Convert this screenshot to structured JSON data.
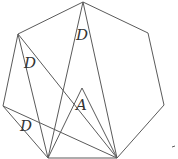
{
  "diagram": {
    "type": "geometry",
    "shape": "heptagon with inscribed triangles",
    "labels": [
      {
        "text": "D",
        "x": 76,
        "y": 40
      },
      {
        "text": "D",
        "x": 24,
        "y": 68
      },
      {
        "text": "A",
        "x": 76,
        "y": 110
      },
      {
        "text": "D",
        "x": 20,
        "y": 131
      }
    ],
    "colors": {
      "stroke": "#5a5a5a",
      "text": "#333333",
      "background": "#ffffff"
    }
  }
}
